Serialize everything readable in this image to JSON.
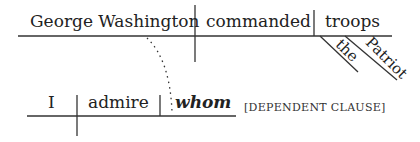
{
  "diagram": {
    "main_clause": {
      "subject": "George Washington",
      "verb": "commanded",
      "object": "troops",
      "modifiers": [
        "the",
        "Patriot"
      ]
    },
    "dependent_clause": {
      "subject": "I",
      "verb": "admire",
      "object": "whom",
      "label": "[DEPENDENT CLAUSE]"
    },
    "connector": "dotted-line-from-subject-to-whom",
    "line_color": "#333333"
  }
}
